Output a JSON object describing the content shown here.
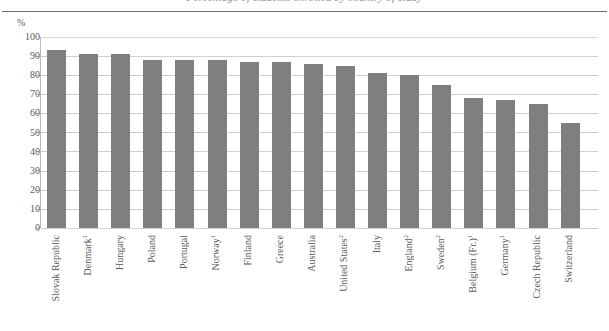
{
  "figure": {
    "cut_title": "Percentage of students enrolled by country of study",
    "unit_label": "%"
  },
  "chart_data": {
    "type": "bar",
    "title": "",
    "subtitle": "",
    "xlabel": "",
    "ylabel": "%",
    "ylim": [
      0,
      100
    ],
    "ytick_step": 10,
    "grid": true,
    "legend": false,
    "bar_color": "#7f7f7f",
    "yticks": [
      "100",
      "90",
      "80",
      "70",
      "60",
      "50",
      "40",
      "30",
      "20",
      "10",
      "0"
    ],
    "categories": [
      "Slovak Republic",
      "Denmark",
      "Hungary",
      "Poland",
      "Portugal",
      "Norway",
      "Finland",
      "Greece",
      "Australia",
      "United States",
      "Italy",
      "England",
      "Sweden",
      "Belgium (Fr.)",
      "Germany",
      "Czech Republic",
      "Switzerland"
    ],
    "category_footnotes": [
      "",
      "1",
      "",
      "",
      "",
      "1",
      "",
      "",
      "",
      "2",
      "",
      "2",
      "2",
      "1",
      "1",
      "",
      ""
    ],
    "values": [
      93,
      91,
      91,
      88,
      88,
      88,
      87,
      87,
      86,
      85,
      81,
      80,
      75,
      68,
      67,
      65,
      55
    ]
  }
}
